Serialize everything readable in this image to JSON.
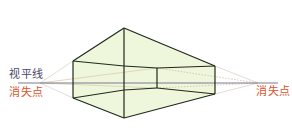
{
  "labels": {
    "horizon": "视平线",
    "vp_left": "消失点",
    "vp_right": "消失点"
  },
  "colors": {
    "fill": "#eef6dc",
    "edge": "#1f2a1a",
    "horizon": "#6c6b86",
    "guide": "#d9cfc7",
    "guide_dotted": "#c9b99a",
    "horizon_label": "#4a4668",
    "vp_label": "#d8552e"
  },
  "diagram": {
    "type": "two-point perspective box",
    "horizon_y": 83,
    "vanishing_points": [
      [
        40,
        83
      ],
      [
        258,
        83
      ]
    ],
    "front_edge": {
      "x": 124,
      "top": 28,
      "bottom": 118
    },
    "left_edge": {
      "x": 73,
      "top": 61,
      "bottom": 98
    },
    "right_edge": {
      "x": 215,
      "top": 66,
      "bottom": 94
    },
    "inner_edge": {
      "x": 157,
      "top": 68,
      "bottom": 88
    }
  }
}
